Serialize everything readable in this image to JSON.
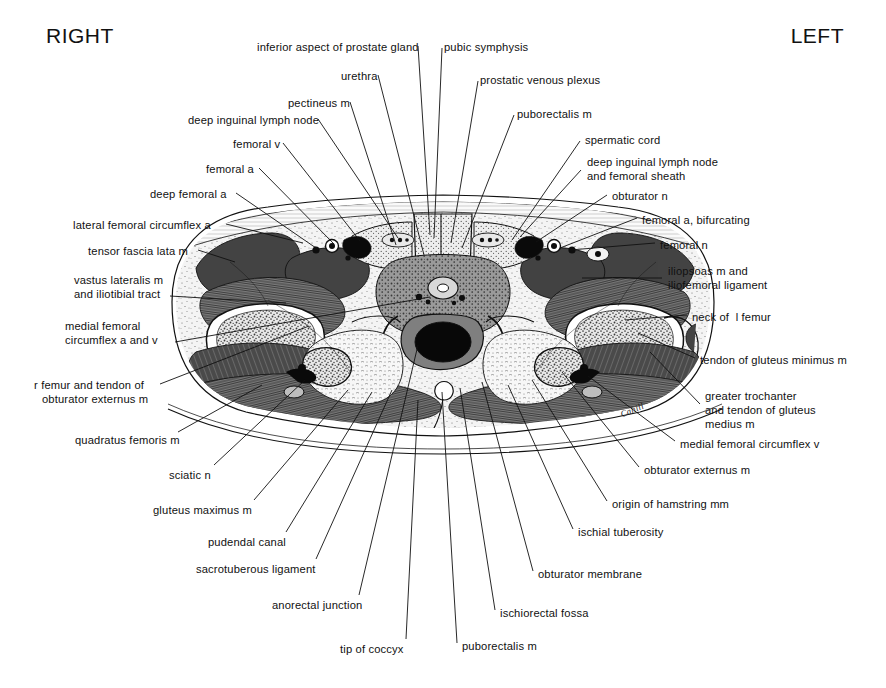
{
  "headers": {
    "right": "RIGHT",
    "left": "LEFT"
  },
  "signature": "Cahill",
  "labels_left": [
    {
      "text": "deep inguinal lymph node",
      "x": 188,
      "y": 114,
      "lx": 318,
      "ly": 119,
      "tx": 398,
      "ty": 238
    },
    {
      "text": "femoral v",
      "x": 233,
      "y": 138,
      "lx": 283,
      "ly": 143,
      "tx": 360,
      "ty": 241
    },
    {
      "text": "femoral a",
      "x": 206,
      "y": 163,
      "lx": 259,
      "ly": 168,
      "tx": 334,
      "ty": 244
    },
    {
      "text": "deep femoral a",
      "x": 150,
      "y": 188,
      "lx": 236,
      "ly": 193,
      "tx": 316,
      "ty": 248
    },
    {
      "text": "lateral femoral circumflex a",
      "x": 73,
      "y": 219,
      "lx": 226,
      "ly": 224,
      "tx": 303,
      "ty": 243
    },
    {
      "text": "tensor fascia lata m",
      "x": 88,
      "y": 245,
      "lx": 198,
      "ly": 250,
      "tx": 235,
      "ty": 262
    },
    {
      "text": "vastus lateralis m",
      "x": 74,
      "y": 274,
      "lx": 170,
      "ly": 296,
      "tx": 286,
      "ty": 303
    },
    {
      "text": "and iliotibial tract",
      "x": 74,
      "y": 288,
      "lx": null,
      "ly": null,
      "tx": null,
      "ty": null
    },
    {
      "text": "medial femoral",
      "x": 65,
      "y": 320,
      "lx": 175,
      "ly": 342,
      "tx": 430,
      "ty": 297
    },
    {
      "text": "circumflex a and v",
      "x": 65,
      "y": 334,
      "lx": null,
      "ly": null,
      "tx": null,
      "ty": null
    },
    {
      "text": "r femur and tendon of",
      "x": 34,
      "y": 379,
      "lx": 160,
      "ly": 384,
      "tx": 309,
      "ty": 326
    },
    {
      "text": "obturator externus m",
      "x": 42,
      "y": 393,
      "lx": null,
      "ly": null,
      "tx": null,
      "ty": null
    },
    {
      "text": "quadratus femoris m",
      "x": 75,
      "y": 434,
      "lx": 178,
      "ly": 432,
      "tx": 262,
      "ty": 385
    },
    {
      "text": "sciatic n",
      "x": 169,
      "y": 469,
      "lx": 214,
      "ly": 465,
      "tx": 305,
      "ty": 380
    },
    {
      "text": "gluteus maximus m",
      "x": 153,
      "y": 504,
      "lx": 254,
      "ly": 500,
      "tx": 348,
      "ty": 390
    },
    {
      "text": "pudendal canal",
      "x": 208,
      "y": 536,
      "lx": 286,
      "ly": 532,
      "tx": 372,
      "ty": 392
    },
    {
      "text": "sacrotuberous ligament",
      "x": 196,
      "y": 563,
      "lx": 316,
      "ly": 559,
      "tx": 392,
      "ty": 390
    },
    {
      "text": "anorectal junction",
      "x": 272,
      "y": 599,
      "lx": 359,
      "ly": 595,
      "tx": 418,
      "ty": 345
    },
    {
      "text": "tip of coccyx",
      "x": 340,
      "y": 643,
      "lx": 406,
      "ly": 639,
      "tx": 418,
      "ty": 400
    }
  ],
  "labels_top_center": [
    {
      "text": "inferior aspect of prostate gland",
      "x": 257,
      "y": 41,
      "lx": 418,
      "ly": 46,
      "tx": 430,
      "ty": 235
    },
    {
      "text": "urethra",
      "x": 341,
      "y": 70,
      "lx": 378,
      "ly": 75,
      "tx": 424,
      "ty": 255
    },
    {
      "text": "pectineus m",
      "x": 288,
      "y": 97,
      "lx": 350,
      "ly": 102,
      "tx": 396,
      "ty": 245
    },
    {
      "text": "pubic symphysis",
      "x": 444,
      "y": 41,
      "lx": 442,
      "ly": 48,
      "tx": 434,
      "ty": 238
    },
    {
      "text": "prostatic venous plexus",
      "x": 480,
      "y": 74,
      "lx": 478,
      "ly": 81,
      "tx": 451,
      "ty": 243
    },
    {
      "text": "puborectalis m",
      "x": 517,
      "y": 108,
      "lx": 514,
      "ly": 115,
      "tx": 462,
      "ty": 248
    }
  ],
  "labels_right": [
    {
      "text": "spermatic cord",
      "x": 585,
      "y": 134,
      "lx": 580,
      "ly": 141,
      "tx": 512,
      "ty": 240
    },
    {
      "text": "deep inguinal lymph node",
      "x": 587,
      "y": 156,
      "lx": 581,
      "ly": 170,
      "tx": 520,
      "ty": 237
    },
    {
      "text": "and femoral sheath",
      "x": 587,
      "y": 170,
      "lx": null,
      "ly": null,
      "tx": null,
      "ty": null
    },
    {
      "text": "obturator n",
      "x": 612,
      "y": 190,
      "lx": 607,
      "ly": 195,
      "tx": 536,
      "ty": 242
    },
    {
      "text": "femoral a, bifurcating",
      "x": 642,
      "y": 214,
      "lx": 637,
      "ly": 218,
      "tx": 560,
      "ty": 248
    },
    {
      "text": "femoral n",
      "x": 660,
      "y": 239,
      "lx": 655,
      "ly": 243,
      "tx": 570,
      "ty": 250
    },
    {
      "text": "iliopsoas m and",
      "x": 668,
      "y": 265,
      "lx": 662,
      "ly": 278,
      "tx": 582,
      "ty": 278
    },
    {
      "text": "iliofemoral ligament",
      "x": 668,
      "y": 279,
      "lx": null,
      "ly": null,
      "tx": null,
      "ty": null
    },
    {
      "text": "neck of  l femur",
      "x": 692,
      "y": 311,
      "lx": 687,
      "ly": 315,
      "tx": 625,
      "ty": 320
    },
    {
      "text": "tendon of gluteus minimus m",
      "x": 700,
      "y": 354,
      "lx": 695,
      "ly": 358,
      "tx": 638,
      "ty": 333
    },
    {
      "text": "greater trochanter",
      "x": 705,
      "y": 390,
      "lx": 700,
      "ly": 404,
      "tx": 650,
      "ty": 352
    },
    {
      "text": "and tendon of gluteus",
      "x": 705,
      "y": 404,
      "lx": null,
      "ly": null,
      "tx": null,
      "ty": null
    },
    {
      "text": "medius m",
      "x": 705,
      "y": 418,
      "lx": null,
      "ly": null,
      "tx": null,
      "ty": null
    },
    {
      "text": "medial femoral circumflex v",
      "x": 680,
      "y": 438,
      "lx": 675,
      "ly": 441,
      "tx": 588,
      "ty": 376
    },
    {
      "text": "obturator externus m",
      "x": 644,
      "y": 464,
      "lx": 639,
      "ly": 467,
      "tx": 562,
      "ty": 372
    },
    {
      "text": "origin of hamstring mm",
      "x": 612,
      "y": 498,
      "lx": 607,
      "ly": 501,
      "tx": 532,
      "ty": 380
    },
    {
      "text": "ischial tuberosity",
      "x": 578,
      "y": 526,
      "lx": 573,
      "ly": 529,
      "tx": 508,
      "ty": 385
    },
    {
      "text": "obturator membrane",
      "x": 538,
      "y": 568,
      "lx": 533,
      "ly": 571,
      "tx": 482,
      "ty": 382
    },
    {
      "text": "ischiorectal fossa",
      "x": 500,
      "y": 607,
      "lx": 495,
      "ly": 610,
      "tx": 460,
      "ty": 388
    },
    {
      "text": "puborectalis m",
      "x": 462,
      "y": 640,
      "lx": 457,
      "ly": 643,
      "tx": 442,
      "ty": 392
    }
  ],
  "colors": {
    "ink": "#111111",
    "paper": "#ffffff",
    "muscle_dark": "#4a4a4a",
    "muscle_mid": "#6e6e6e",
    "fat": "#efefef",
    "bone_marrow": "#c9c9c9",
    "lumen": "#0a0a0a"
  },
  "illustration": {
    "type": "anatomical-cross-section",
    "region": "male pelvis at level of hip joints",
    "view": "axial / transverse section"
  }
}
